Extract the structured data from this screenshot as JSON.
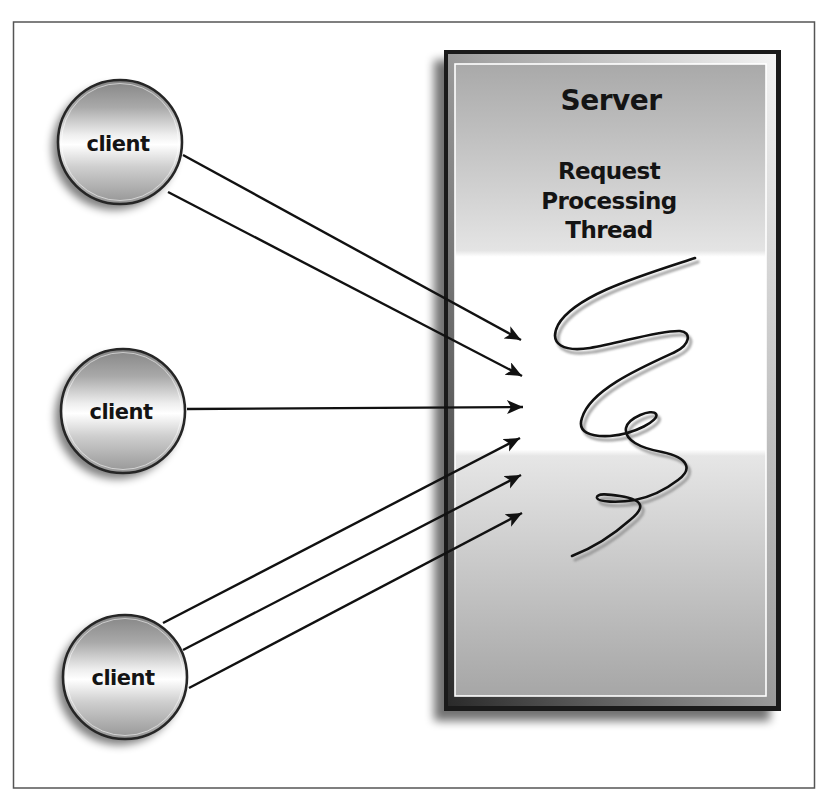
{
  "diagram": {
    "server": {
      "title": "Server",
      "label_lines": [
        "Request",
        "Processing",
        "Thread"
      ]
    },
    "clients": [
      {
        "label": "client",
        "arrow_count": 2
      },
      {
        "label": "client",
        "arrow_count": 1
      },
      {
        "label": "client",
        "arrow_count": 3
      }
    ],
    "colors": {
      "frame": "#555555",
      "server_border": "#1a1a1a",
      "arrow": "#111111",
      "thread": "#111111",
      "background": "#ffffff"
    }
  }
}
